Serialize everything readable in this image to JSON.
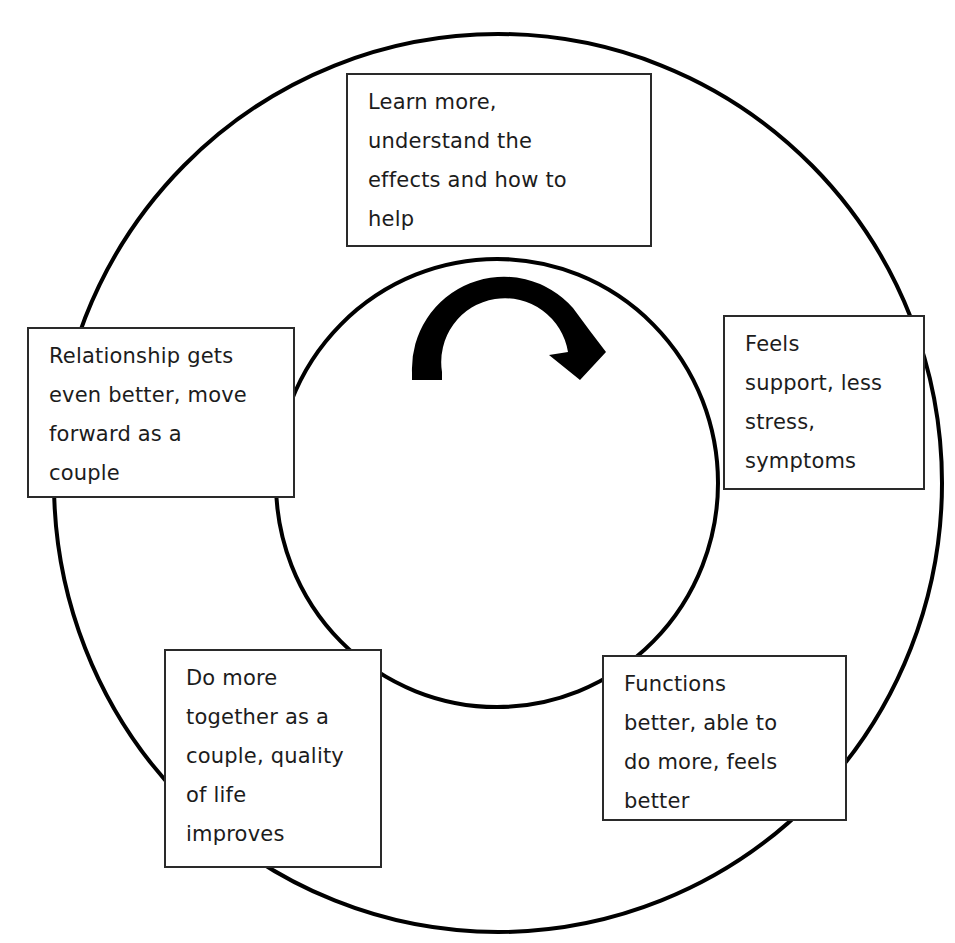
{
  "diagram": {
    "type": "cycle",
    "direction": "clockwise",
    "colors": {
      "stroke": "#000000",
      "box_border": "#2a2a2a",
      "text": "#1c1c1c",
      "background": "#ffffff"
    },
    "center_icon": "clockwise-curved-arrow-icon",
    "steps": [
      {
        "position": "top",
        "lines": [
          "Learn more,",
          "understand the",
          "effects and how to",
          "help"
        ]
      },
      {
        "position": "right",
        "lines": [
          "Feels",
          "support, less",
          "stress,",
          "symptoms"
        ]
      },
      {
        "position": "bottom-right",
        "lines": [
          "Functions",
          "better, able to",
          "do more, feels",
          "better"
        ]
      },
      {
        "position": "bottom-left",
        "lines": [
          "Do more",
          "together as a",
          "couple, quality",
          "of life",
          "improves"
        ]
      },
      {
        "position": "left",
        "lines": [
          "Relationship gets",
          "even better, move",
          "forward as a",
          "couple"
        ]
      }
    ]
  }
}
